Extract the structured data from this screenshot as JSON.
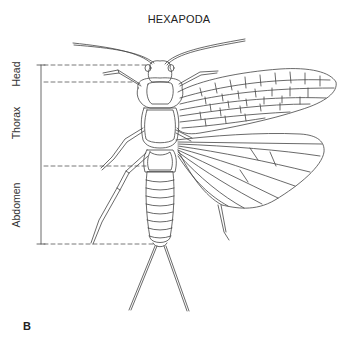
{
  "figure": {
    "title": "HEXAPODA",
    "panel_label": "B",
    "regions": [
      {
        "label": "Head",
        "y_top": 65,
        "y_bottom": 82
      },
      {
        "label": "Thorax",
        "y_top": 82,
        "y_bottom": 166
      },
      {
        "label": "Abdomen",
        "y_top": 166,
        "y_bottom": 244
      }
    ],
    "line_color": "#444444",
    "dash_color": "#555555"
  }
}
